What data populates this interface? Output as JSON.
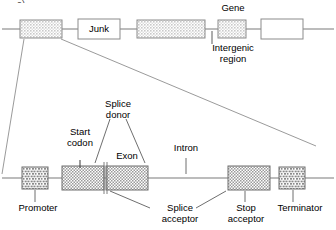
{
  "figure": {
    "corner_mark": "a)",
    "top_panel": {
      "name": "genomic-overview",
      "labels": [
        {
          "id": "gene",
          "text": "Gene",
          "x": 233,
          "y": 4
        },
        {
          "id": "intergenic",
          "text": "Intergenic\nregion",
          "x": 233,
          "y": 44
        }
      ],
      "boxes": [
        {
          "id": "gene-box-1",
          "fill": "hatched",
          "x": 20,
          "y": 20,
          "w": 42,
          "h": 18
        },
        {
          "id": "junk-box",
          "fill": "white",
          "label": "Junk",
          "x": 78,
          "y": 19,
          "w": 42,
          "h": 20
        },
        {
          "id": "gene-box-2",
          "fill": "hatched",
          "x": 137,
          "y": 20,
          "w": 68,
          "h": 18
        },
        {
          "id": "gene-box-3",
          "fill": "hatched",
          "x": 218,
          "y": 20,
          "w": 28,
          "h": 18
        },
        {
          "id": "gene-box-4",
          "fill": "white",
          "x": 261,
          "y": 19,
          "w": 42,
          "h": 20
        }
      ]
    },
    "bottom_panel": {
      "name": "gene-structure-detail",
      "labels": [
        {
          "id": "splice-donor",
          "text": "Splice\ndonor",
          "x": 116,
          "y": 100
        },
        {
          "id": "start-codon",
          "text": "Start\ncodon",
          "x": 74,
          "y": 128
        },
        {
          "id": "exon",
          "text": "Exon",
          "x": 122,
          "y": 152
        },
        {
          "id": "intron",
          "text": "Intron",
          "x": 185,
          "y": 144
        },
        {
          "id": "promoter",
          "text": "Promoter",
          "x": 38,
          "y": 204
        },
        {
          "id": "splice-acceptor",
          "text": "Splice\nacceptor",
          "x": 158,
          "y": 199
        },
        {
          "id": "stop-acceptor",
          "text": "Stop\nacceptor",
          "x": 241,
          "y": 199
        },
        {
          "id": "terminator",
          "text": "Terminator",
          "x": 296,
          "y": 204
        }
      ],
      "boxes": [
        {
          "id": "promoter-box",
          "fill": "brick",
          "x": 22,
          "y": 167,
          "w": 26,
          "h": 22
        },
        {
          "id": "exon-box-1",
          "fill": "checker",
          "x": 62,
          "y": 166,
          "w": 42,
          "h": 24
        },
        {
          "id": "exon-box-2",
          "fill": "checker",
          "x": 106,
          "y": 166,
          "w": 42,
          "h": 24
        },
        {
          "id": "exon-box-3",
          "fill": "checker",
          "x": 228,
          "y": 166,
          "w": 42,
          "h": 24
        },
        {
          "id": "terminator-box",
          "fill": "brick",
          "x": 279,
          "y": 167,
          "w": 26,
          "h": 22
        }
      ]
    },
    "colors": {
      "line": "#6f6f6f",
      "box_stroke": "#808080",
      "hatch_fill": "#d9d9d9",
      "text": "#000000",
      "background": "#ffffff"
    }
  }
}
